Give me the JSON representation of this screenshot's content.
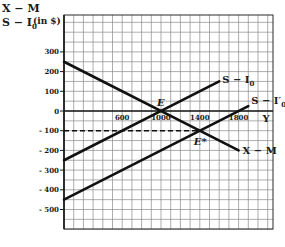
{
  "chart_data": {
    "type": "line",
    "title": "",
    "ylabel_line1": "X − M",
    "ylabel_line2": "S − I",
    "ylabel_line2_sub": "0",
    "ylabel_unit": "(in $)",
    "xlabel": "Y",
    "xlim": [
      0,
      2150
    ],
    "ylim": [
      -600,
      500
    ],
    "grid": true,
    "grid_step_x": 100,
    "grid_step_y": 50,
    "x_ticks": [
      {
        "value": 600,
        "label": "600"
      },
      {
        "value": 1000,
        "label": "1000"
      },
      {
        "value": 1400,
        "label": "1400"
      },
      {
        "value": 1800,
        "label": "1800"
      }
    ],
    "y_ticks": [
      {
        "value": 300,
        "label": "300"
      },
      {
        "value": 200,
        "label": "200"
      },
      {
        "value": 100,
        "label": "100"
      },
      {
        "value": 0,
        "label": "0"
      },
      {
        "value": -100,
        "label": "- 100"
      },
      {
        "value": -200,
        "label": "- 200"
      },
      {
        "value": -300,
        "label": "- 300"
      },
      {
        "value": -400,
        "label": "- 400"
      },
      {
        "value": -500,
        "label": "- 500"
      }
    ],
    "series": [
      {
        "name": "X − M",
        "label": "X − M",
        "label_sub": "",
        "points": [
          [
            0,
            250
          ],
          [
            1800,
            -200
          ]
        ]
      },
      {
        "name": "S − I0",
        "label": "S − I",
        "label_sub": "0",
        "points": [
          [
            0,
            -250
          ],
          [
            1600,
            150
          ]
        ]
      },
      {
        "name": "S − I'0",
        "label": "S − I′",
        "label_sub": "0",
        "points": [
          [
            0,
            -450
          ],
          [
            1900,
            25
          ]
        ]
      }
    ],
    "reference_lines": [
      {
        "type": "dashed-horizontal",
        "y": -100,
        "x_from": 0,
        "x_to": 1400
      }
    ],
    "annotations": [
      {
        "label": "E",
        "x": 1000,
        "y": 0
      },
      {
        "label": "E*",
        "x": 1400,
        "y": -100
      }
    ]
  }
}
